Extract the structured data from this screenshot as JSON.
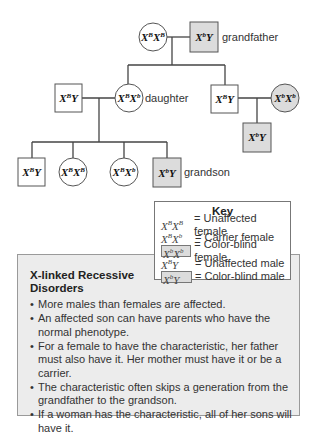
{
  "pedigree": {
    "gen1": {
      "mother": {
        "genotype_base": "X",
        "sup1": "B",
        "base2": "X",
        "sup2": "B",
        "shape": "circle",
        "affected": false
      },
      "father": {
        "genotype_base": "X",
        "sup1": "b",
        "base2": "Y",
        "shape": "square",
        "affected": true,
        "label": "grandfather"
      }
    },
    "gen2": [
      {
        "genotype_base": "X",
        "sup1": "B",
        "base2": "Y",
        "shape": "square",
        "affected": false
      },
      {
        "genotype_base": "X",
        "sup1": "B",
        "base2": "X",
        "sup2": "b",
        "shape": "circle",
        "affected": false,
        "label": "daughter"
      },
      {
        "genotype_base": "X",
        "sup1": "B",
        "base2": "Y",
        "shape": "square",
        "affected": false
      },
      {
        "genotype_base": "X",
        "sup1": "b",
        "base2": "X",
        "sup2": "b",
        "shape": "circle",
        "affected": true
      }
    ],
    "gen3_left": [
      {
        "genotype_base": "X",
        "sup1": "B",
        "base2": "Y",
        "shape": "square",
        "affected": false
      },
      {
        "genotype_base": "X",
        "sup1": "B",
        "base2": "X",
        "sup2": "B",
        "shape": "circle",
        "affected": false
      },
      {
        "genotype_base": "X",
        "sup1": "B",
        "base2": "X",
        "sup2": "b",
        "shape": "circle",
        "affected": false
      },
      {
        "genotype_base": "X",
        "sup1": "b",
        "base2": "Y",
        "shape": "square",
        "affected": true,
        "label": "grandson"
      }
    ],
    "gen3_right": [
      {
        "genotype_base": "X",
        "sup1": "b",
        "base2": "Y",
        "shape": "square",
        "affected": true
      }
    ],
    "colors": {
      "affected_fill": "#dcdcdc",
      "unaffected_fill": "#ffffff",
      "stroke": "#555555"
    }
  },
  "key": {
    "title": "Key",
    "rows": [
      {
        "b1": "X",
        "s1": "B",
        "b2": "X",
        "s2": "B",
        "boxed": false,
        "desc": "= Unaffected female"
      },
      {
        "b1": "X",
        "s1": "B",
        "b2": "X",
        "s2": "b",
        "boxed": false,
        "desc": "= Carrier female"
      },
      {
        "b1": "X",
        "s1": "b",
        "b2": "X",
        "s2": "b",
        "boxed": true,
        "desc": "= Color-blind female"
      },
      {
        "b1": "X",
        "s1": "B",
        "b2": "Y",
        "s2": "",
        "boxed": false,
        "desc": "= Unaffected male"
      },
      {
        "b1": "X",
        "s1": "b",
        "b2": "Y",
        "s2": "",
        "boxed": true,
        "desc": "= Color-blind male"
      }
    ]
  },
  "info": {
    "title": "X-linked Recessive Disorders",
    "bullets": [
      "More males than females are affected.",
      "An affected son can have parents who have the normal phenotype.",
      "For a female to have the characteristic, her father must also have it. Her mother must have it or be a carrier.",
      "The characteristic often skips a generation from the grandfather to the grandson.",
      "If a woman has the characteristic, all of her sons will have it."
    ]
  }
}
